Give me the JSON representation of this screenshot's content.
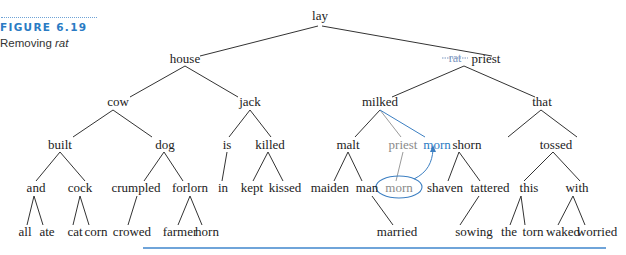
{
  "caption": {
    "figure_label": "FIGURE 6.19",
    "title_prefix": "Removing ",
    "title_italic": "rat"
  },
  "colors": {
    "accent": "#2a7bc4",
    "removed_node": "#8a8a8a",
    "text": "#222222",
    "rule": "#3f86cc"
  },
  "tree": {
    "root": "lay",
    "nodes": {
      "lay": "lay",
      "house": "house",
      "rat": "rat",
      "priest_top": "priest",
      "cow": "cow",
      "jack": "jack",
      "milked": "milked",
      "that": "that",
      "built": "built",
      "dog": "dog",
      "is": "is",
      "killed": "killed",
      "malt": "malt",
      "priest_old": "priest",
      "morn_new": "morn",
      "shorn": "shorn",
      "tossed": "tossed",
      "and": "and",
      "cock": "cock",
      "crumpled": "crumpled",
      "forlorn": "forlorn",
      "in": "in",
      "kept": "kept",
      "kissed": "kissed",
      "maiden": "maiden",
      "man": "man",
      "morn_old": "morn",
      "shaven": "shaven",
      "tattered": "tattered",
      "this": "this",
      "with": "with",
      "all": "all",
      "ate": "ate",
      "cat": "cat",
      "corn": "corn",
      "crowed": "crowed",
      "farmer": "farmer",
      "horn": "horn",
      "married": "married",
      "sowing": "sowing",
      "the": "the",
      "torn": "torn",
      "waked": "waked",
      "worried": "worried"
    },
    "annotations": {
      "struck_key": "rat",
      "replacement_key": "priest",
      "circled_node": "morn",
      "moved_to": "morn"
    }
  }
}
